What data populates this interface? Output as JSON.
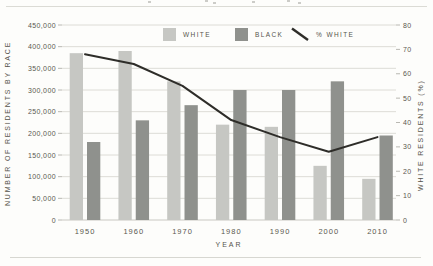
{
  "colors": {
    "background": "#fdfdfb",
    "white_bar": "#c6c7c3",
    "black_bar": "#8f918d",
    "pct_line": "#2e2d29",
    "gridline": "#dddcd6",
    "baseline": "#c9c8c2",
    "tick_text": "#5b584f",
    "label_text": "#56534b"
  },
  "chart_data": {
    "type": "bar",
    "subtype": "grouped bars with overlaid line on secondary axis",
    "categories": [
      "1950",
      "1960",
      "1970",
      "1980",
      "1990",
      "2000",
      "2010"
    ],
    "series": [
      {
        "name": "WHITE",
        "type": "bar",
        "axis": "left",
        "values": [
          385000,
          390000,
          320000,
          220000,
          215000,
          125000,
          95000
        ]
      },
      {
        "name": "BLACK",
        "type": "bar",
        "axis": "left",
        "values": [
          180000,
          230000,
          265000,
          300000,
          300000,
          320000,
          195000
        ]
      },
      {
        "name": "% WHITE",
        "type": "line",
        "axis": "right",
        "values": [
          68,
          64,
          55,
          41,
          34,
          28,
          34
        ]
      }
    ],
    "left_axis": {
      "title": "NUMBER OF RESIDENTS BY RACE",
      "min": 0,
      "max": 450000,
      "tick_step": 50000,
      "tick_labels": [
        "0",
        "50,000",
        "100,000",
        "150,000",
        "200,000",
        "250,000",
        "300,000",
        "350,000",
        "400,000",
        "450,000"
      ]
    },
    "right_axis": {
      "title": "WHITE RESIDENTS (%)",
      "min": 0,
      "max": 80,
      "tick_step": 10,
      "tick_labels": [
        "0",
        "10",
        "20",
        "30",
        "40",
        "50",
        "60",
        "70",
        "80"
      ]
    },
    "x_axis": {
      "title": "YEAR"
    },
    "legend": {
      "position": "top-inside",
      "items": [
        "WHITE",
        "BLACK",
        "% WHITE"
      ]
    },
    "grid": "horizontal only"
  }
}
